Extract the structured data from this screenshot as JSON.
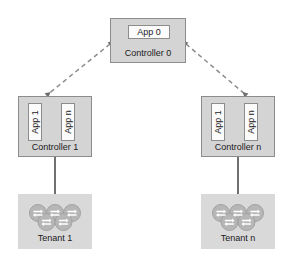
{
  "diagram": {
    "colors": {
      "box_fill": "#d4d4d4",
      "box_border": "#8c8c8c",
      "app_fill": "#fbfbfb",
      "tenant_fill": "#d9d9d9",
      "node_fill": "#b3b3b3",
      "node_stroke": "#9a9a9a",
      "line": "#333333",
      "dashed_line": "#8c8c8c",
      "text": "#1a1a1a"
    },
    "root_controller": {
      "label": "Controller 0",
      "apps": [
        {
          "label": "App 0"
        }
      ]
    },
    "controllers": [
      {
        "label": "Controller 1",
        "apps": [
          {
            "label": "App 1"
          },
          {
            "label": "App n"
          }
        ]
      },
      {
        "label": "Controller n",
        "apps": [
          {
            "label": "App 1"
          },
          {
            "label": "App n"
          }
        ]
      }
    ],
    "tenants": [
      {
        "label": "Tenant 1",
        "icon": "network-cluster-icon",
        "node_count": 5
      },
      {
        "label": "Tenant n",
        "icon": "network-cluster-icon",
        "node_count": 5
      }
    ],
    "connections": [
      {
        "from": "Controller 1",
        "to": "Controller 0",
        "style": "dashed",
        "arrows": "both"
      },
      {
        "from": "Controller n",
        "to": "Controller 0",
        "style": "dashed",
        "arrows": "both"
      },
      {
        "from": "Controller 1",
        "to": "Tenant 1",
        "style": "solid",
        "arrows": "none"
      },
      {
        "from": "Controller n",
        "to": "Tenant n",
        "style": "solid",
        "arrows": "none"
      }
    ]
  }
}
